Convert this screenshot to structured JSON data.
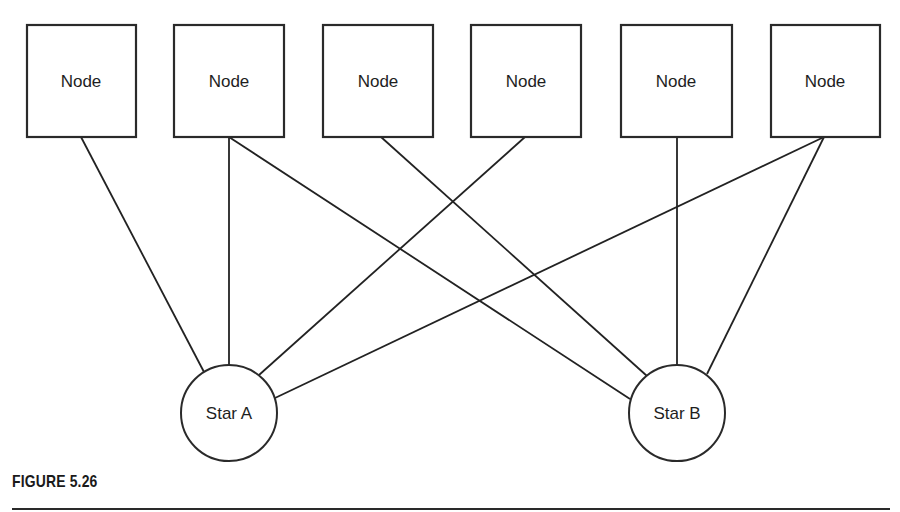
{
  "figure": {
    "caption": "FIGURE 5.26"
  },
  "colors": {
    "stroke": "#2a2a2a",
    "background": "#ffffff",
    "text": "#1e1e1e"
  },
  "nodes": [
    {
      "id": "node-1",
      "label": "Node"
    },
    {
      "id": "node-2",
      "label": "Node"
    },
    {
      "id": "node-3",
      "label": "Node"
    },
    {
      "id": "node-4",
      "label": "Node"
    },
    {
      "id": "node-5",
      "label": "Node"
    },
    {
      "id": "node-6",
      "label": "Node"
    }
  ],
  "stars": [
    {
      "id": "star-a",
      "label": "Star A"
    },
    {
      "id": "star-b",
      "label": "Star B"
    }
  ],
  "edges": [
    {
      "from": "node-1",
      "to": "star-a"
    },
    {
      "from": "node-2",
      "to": "star-a"
    },
    {
      "from": "node-2",
      "to": "star-b"
    },
    {
      "from": "node-3",
      "to": "star-b"
    },
    {
      "from": "node-4",
      "to": "star-a"
    },
    {
      "from": "node-5",
      "to": "star-b"
    },
    {
      "from": "node-6",
      "to": "star-a"
    },
    {
      "from": "node-6",
      "to": "star-b"
    }
  ]
}
